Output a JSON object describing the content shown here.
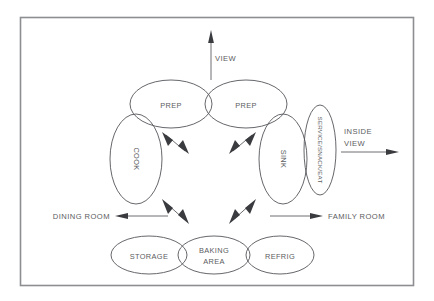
{
  "diagram": {
    "background_color": "#ffffff",
    "frame_color": "#8d8e92",
    "outline_color": "#55565a",
    "text_color": "#5b5c60",
    "arrow_color": "#3a3b3f",
    "bubbles": [
      {
        "id": "prep-left",
        "label": "PREP",
        "orientation": "horizontal",
        "cx": 171,
        "cy": 104,
        "rx": 41,
        "ry": 24
      },
      {
        "id": "prep-right",
        "label": "PREP",
        "orientation": "horizontal",
        "cx": 246,
        "cy": 104,
        "rx": 41,
        "ry": 24
      },
      {
        "id": "cook",
        "label": "COOK",
        "orientation": "vertical",
        "cx": 136,
        "cy": 159,
        "rx": 26,
        "ry": 45
      },
      {
        "id": "sink",
        "label": "SINK",
        "orientation": "vertical",
        "cx": 283,
        "cy": 159,
        "rx": 24,
        "ry": 45
      },
      {
        "id": "service",
        "label": "SERVICE/SNACK/EAT",
        "orientation": "vertical",
        "cx": 320,
        "cy": 150,
        "rx": 16,
        "ry": 45
      },
      {
        "id": "storage",
        "label": "STORAGE",
        "orientation": "horizontal",
        "cx": 149,
        "cy": 255,
        "rx": 38,
        "ry": 19
      },
      {
        "id": "baking-area",
        "label": "BAKING AREA",
        "orientation": "horizontal",
        "cx": 214,
        "cy": 255,
        "rx": 36,
        "ry": 19,
        "line1": "BAKING",
        "line2": "AREA"
      },
      {
        "id": "refrig",
        "label": "REFRIG",
        "orientation": "horizontal",
        "cx": 280,
        "cy": 255,
        "rx": 34,
        "ry": 19
      }
    ],
    "direction_labels": [
      {
        "id": "view",
        "text": "VIEW",
        "x": 215,
        "y": 58,
        "anchor": "start"
      },
      {
        "id": "inside-view",
        "text_line1": "INSIDE",
        "text_line2": "VIEW",
        "x": 344,
        "y": 137,
        "anchor": "start"
      },
      {
        "id": "dining-room",
        "text": "DINING ROOM",
        "x": 110,
        "y": 216,
        "anchor": "end"
      },
      {
        "id": "family-room",
        "text": "FAMILY ROOM",
        "x": 328,
        "y": 216,
        "anchor": "start"
      }
    ],
    "connector_arrows": [
      {
        "id": "prep-left-to-center",
        "from": "prep-left",
        "to": "center",
        "heads": "double"
      },
      {
        "id": "prep-right-to-center",
        "from": "prep-right",
        "to": "center",
        "heads": "double"
      },
      {
        "id": "center-to-storage",
        "from": "center",
        "to": "baking-area-left",
        "heads": "double"
      },
      {
        "id": "center-to-refrig",
        "from": "center",
        "to": "baking-area-right",
        "heads": "double"
      }
    ],
    "direction_arrows": [
      {
        "id": "view-arrow",
        "direction": "up"
      },
      {
        "id": "inside-view-arrow",
        "direction": "right"
      },
      {
        "id": "dining-room-arrow",
        "direction": "left"
      },
      {
        "id": "family-room-arrow",
        "direction": "right"
      }
    ]
  }
}
